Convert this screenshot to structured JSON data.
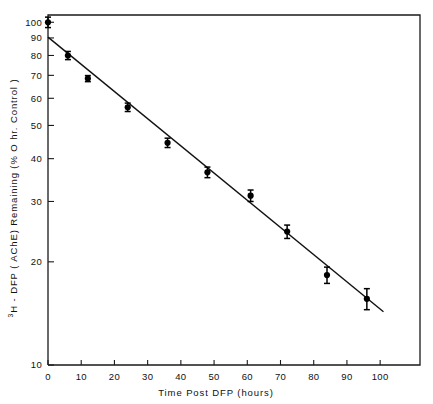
{
  "chart_data": {
    "type": "scatter",
    "title": "",
    "xlabel": "Time Post DFP (hours)",
    "ylabel": "3H - DFP (AChE) Remaining (% O hr. Control)",
    "ylabel_prefix_sup": "3",
    "ylabel_rest": "H - DFP ( AChE) Remaining (% O hr. Control )",
    "yscale": "log",
    "xscale": "linear",
    "xlim": [
      0,
      112
    ],
    "ylim": [
      10,
      105
    ],
    "grid": false,
    "legend": null,
    "xticks": [
      0,
      10,
      20,
      30,
      40,
      50,
      60,
      70,
      80,
      90,
      100
    ],
    "xticklabels": [
      "0",
      "10",
      "20",
      "30",
      "40",
      "50",
      "60",
      "70",
      "80",
      "90",
      "100"
    ],
    "yticks": [
      10,
      20,
      30,
      40,
      50,
      60,
      70,
      80,
      90,
      100
    ],
    "yticklabels": [
      "10",
      "20",
      "30",
      "40",
      "50",
      "60",
      "70",
      "80",
      "90",
      "100"
    ],
    "marker": "filled-circle",
    "errorbars": true,
    "points": [
      {
        "x": 0,
        "y": 100,
        "yerr": 3.5
      },
      {
        "x": 6,
        "y": 80,
        "yerr": 2.2
      },
      {
        "x": 12,
        "y": 68.5,
        "yerr": 1.4
      },
      {
        "x": 24,
        "y": 56.5,
        "yerr": 1.6
      },
      {
        "x": 36,
        "y": 44.5,
        "yerr": 1.4
      },
      {
        "x": 48,
        "y": 36.5,
        "yerr": 1.3
      },
      {
        "x": 61,
        "y": 31.2,
        "yerr": 1.2
      },
      {
        "x": 72,
        "y": 24.5,
        "yerr": 1.1
      },
      {
        "x": 84,
        "y": 18.3,
        "yerr": 1.0
      },
      {
        "x": 96,
        "y": 15.6,
        "yerr": 1.1
      }
    ],
    "fit_line": {
      "name": "regression-line",
      "x_start": 0,
      "y_start": 90.5,
      "x_end": 101,
      "y_end": 14.3
    }
  },
  "axes": {
    "x_axis_name": "x-axis",
    "y_axis_name": "y-axis"
  }
}
